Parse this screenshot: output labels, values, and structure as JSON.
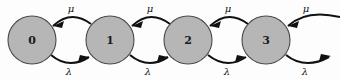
{
  "diagram": {
    "type": "state-transition-diagram",
    "subtype": "birth-death-markov-chain",
    "background_color": "#fdfdfd",
    "node_fill_color": "#b6b6b6",
    "node_stroke_color": "#4a4a4a",
    "edge_color": "#111111",
    "width": 340,
    "height": 79,
    "states": [
      {
        "id": "0",
        "label": "0",
        "cx": 32,
        "cy": 40,
        "r": 24
      },
      {
        "id": "1",
        "label": "1",
        "cx": 110,
        "cy": 40,
        "r": 24
      },
      {
        "id": "2",
        "label": "2",
        "cx": 188,
        "cy": 40,
        "r": 24
      },
      {
        "id": "3",
        "label": "3",
        "cx": 266,
        "cy": 40,
        "r": 24
      }
    ],
    "forward_transitions": [
      {
        "from": "0",
        "to": "1",
        "label": "λ",
        "label_x": 69,
        "label_y": 69,
        "direction": "right"
      },
      {
        "from": "1",
        "to": "2",
        "label": "λ",
        "label_x": 148,
        "label_y": 69,
        "direction": "right"
      },
      {
        "from": "2",
        "to": "3",
        "label": "λ",
        "label_x": 227,
        "label_y": 69,
        "direction": "right"
      },
      {
        "from": "3",
        "to": "4",
        "label": "λ",
        "label_x": 305,
        "label_y": 69,
        "direction": "right"
      }
    ],
    "backward_transitions": [
      {
        "from": "1",
        "to": "0",
        "label": "μ",
        "label_x": 71,
        "label_y": 8,
        "direction": "left"
      },
      {
        "from": "2",
        "to": "1",
        "label": "μ",
        "label_x": 150,
        "label_y": 8,
        "direction": "left"
      },
      {
        "from": "3",
        "to": "2",
        "label": "μ",
        "label_x": 228,
        "label_y": 8,
        "direction": "left"
      },
      {
        "from": "4",
        "to": "3",
        "label": "μ",
        "label_x": 306,
        "label_y": 8,
        "direction": "left"
      }
    ]
  }
}
